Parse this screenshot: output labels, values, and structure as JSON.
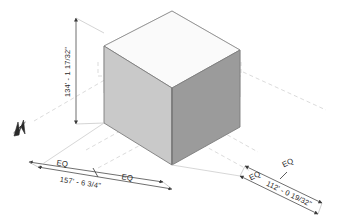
{
  "drawing": {
    "title": "Isometric Massing Study",
    "background_color": "#ffffff",
    "north_arrow": {
      "icon": "north-arrow-icon",
      "label": "N"
    },
    "massing_box": {
      "faces": {
        "top": {
          "name": "top-face",
          "color": "#f7f7f7"
        },
        "left": {
          "name": "left-face",
          "color": "#c8c8c8"
        },
        "right": {
          "name": "right-face",
          "color": "#9a9a9a"
        },
        "interior_left": {
          "name": "interior-left-face",
          "color": "#ededed"
        },
        "interior_back": {
          "name": "interior-back-face",
          "color": "#e3e3e3"
        }
      },
      "edge_color": "#7d7d7d"
    },
    "guide_lines": {
      "color": "#cfcfcf",
      "style": "dashed"
    },
    "dimension_line_color": "#4a4a4a"
  },
  "dimensions": {
    "vertical": {
      "name": "height-dimension",
      "value": "134' - 1 17/32\""
    },
    "left_overall": {
      "name": "left-overall-dimension",
      "value": "157' - 6 3/4\""
    },
    "right_overall": {
      "name": "right-overall-dimension",
      "value": "112' - 0 19/32\""
    },
    "equal_segments": {
      "left_near": "EQ",
      "left_far": "EQ",
      "right_near": "EQ",
      "right_far": "EQ"
    }
  }
}
